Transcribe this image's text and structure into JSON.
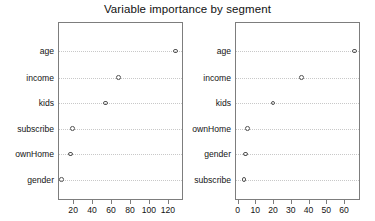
{
  "chart_data": {
    "type": "scatter",
    "title": "Variable importance by segment",
    "xlabel": "",
    "ylabel": "",
    "grid": true,
    "legend": "none",
    "marker": "open-circle",
    "panels": [
      {
        "name": "segment-panel-1",
        "categories": [
          "age",
          "income",
          "kids",
          "subscribe",
          "ownHome",
          "gender"
        ],
        "values": [
          128,
          68,
          54,
          19,
          17,
          8
        ],
        "xlim": [
          4,
          136
        ],
        "xticks": [
          20,
          40,
          60,
          80,
          100,
          120
        ],
        "xticklabels": [
          "20",
          "40",
          "60",
          "80",
          "100",
          "120"
        ]
      },
      {
        "name": "segment-panel-2",
        "categories": [
          "age",
          "income",
          "kids",
          "ownHome",
          "gender",
          "subscribe"
        ],
        "values": [
          66,
          36,
          20,
          5.5,
          4.5,
          3.5
        ],
        "xlim": [
          -1.5,
          69
        ],
        "xticks": [
          0,
          10,
          20,
          30,
          40,
          50,
          60
        ],
        "xticklabels": [
          "0",
          "10",
          "20",
          "30",
          "40",
          "50",
          "60"
        ]
      }
    ]
  }
}
